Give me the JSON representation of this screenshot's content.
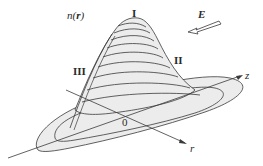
{
  "diagram": {
    "type": "3d-surface-profile",
    "labels": {
      "function": "n(r)",
      "function_prefix": "n(",
      "function_var": "r",
      "function_suffix": ")",
      "region_top": "I",
      "region_right": "II",
      "region_left": "III",
      "field": "E",
      "axis_z": "z",
      "axis_r": "r",
      "origin": "0"
    },
    "colors": {
      "line": "#3a3a3a",
      "fill": "#ececec",
      "background": "#ffffff"
    }
  }
}
